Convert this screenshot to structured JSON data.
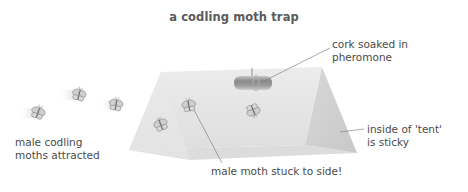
{
  "title": "a codling moth trap",
  "labels": {
    "cork": [
      "cork soaked in",
      "pheromone"
    ],
    "moths_attracted": [
      "male codling",
      "moths attracted"
    ],
    "sticky": [
      "inside of 'tent'",
      "is sticky"
    ],
    "stuck": "male moth stuck to side!"
  },
  "colors": {
    "tent_front": "#e4e4e4",
    "tent_inner": "#d2d2d2",
    "tent_base": "#dadada",
    "cork": "#9a9a9a",
    "leader_line": "#707070",
    "text": "#4a4a4a"
  },
  "moths": {
    "flying": [
      {
        "x": 38,
        "y": 113
      },
      {
        "x": 79,
        "y": 95
      },
      {
        "x": 116,
        "y": 105
      }
    ],
    "stuck": [
      {
        "x": 161,
        "y": 125
      },
      {
        "x": 189,
        "y": 106
      },
      {
        "x": 253,
        "y": 110
      }
    ]
  }
}
